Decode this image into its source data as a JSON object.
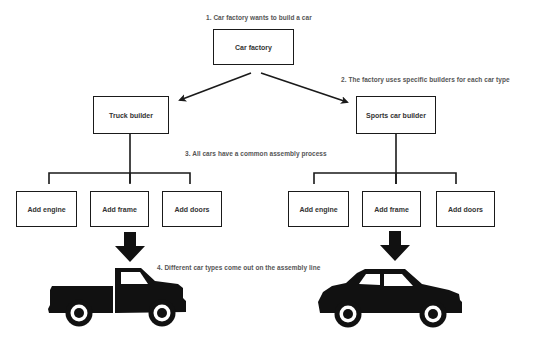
{
  "steps": {
    "step1": "1. Car factory wants to build a car",
    "step2": "2. The factory uses specific builders for each car type",
    "step3": "3. All cars have a common assembly process",
    "step4": "4. Different car types come out on the assembly line"
  },
  "factory": {
    "label": "Car factory"
  },
  "builders": {
    "truck": {
      "label": "Truck builder"
    },
    "sports": {
      "label": "Sports car builder"
    }
  },
  "assembly_steps": {
    "truck": [
      {
        "label": "Add engine"
      },
      {
        "label": "Add frame"
      },
      {
        "label": "Add doors"
      }
    ],
    "sports": [
      {
        "label": "Add engine"
      },
      {
        "label": "Add frame"
      },
      {
        "label": "Add doors"
      }
    ]
  },
  "outputs": {
    "truck": {
      "icon": "pickup-truck-icon"
    },
    "sports": {
      "icon": "sedan-car-icon"
    }
  },
  "colors": {
    "stroke": "#1a1a1a",
    "note_text": "#555555",
    "box_text": "#333333",
    "background": "#ffffff"
  }
}
